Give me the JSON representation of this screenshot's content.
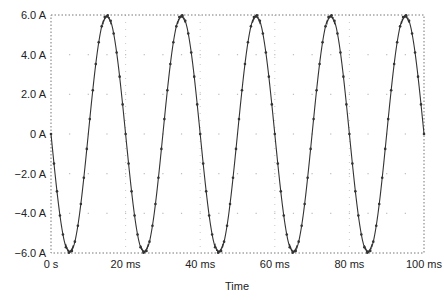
{
  "chart_data": {
    "type": "line",
    "title": "",
    "xlabel": "Time",
    "ylabel": "",
    "xlim": [
      0,
      100
    ],
    "ylim": [
      -6.0,
      6.0
    ],
    "x_unit": "ms",
    "y_unit": "A",
    "x_ticks": [
      0,
      20,
      40,
      60,
      80,
      100
    ],
    "x_tick_labels": [
      "0 s",
      "20 ms",
      "40 ms",
      "60 ms",
      "80 ms",
      "100 ms"
    ],
    "y_ticks": [
      6,
      4,
      2,
      0,
      -2,
      -4,
      -6
    ],
    "y_tick_labels": [
      "6.0 A",
      "4.0 A",
      "2.0 A",
      "0 A",
      "-2.0 A",
      "-4.0 A",
      "-6.0 A"
    ],
    "grid": true,
    "legend": null,
    "series": [
      {
        "name": "I",
        "description": "Sinusoidal current, amplitude 6 A, frequency 50 Hz (period 20 ms), starting at 0 A and going negative first: i(t) = -6 sin(2π·50·t)",
        "amplitude": 6.0,
        "frequency_hz": 50,
        "phase": "negative sine",
        "x": [
          0,
          5,
          10,
          15,
          20,
          25,
          30,
          35,
          40,
          45,
          50,
          55,
          60,
          65,
          70,
          75,
          80,
          85,
          90,
          95,
          100
        ],
        "values": [
          0,
          -6,
          0,
          6,
          0,
          -6,
          0,
          6,
          0,
          -6,
          0,
          6,
          0,
          -6,
          0,
          6,
          0,
          -6,
          0,
          6,
          0
        ],
        "markers": true,
        "color": "#333333"
      }
    ]
  }
}
